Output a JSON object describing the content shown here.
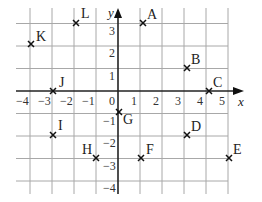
{
  "diagram": {
    "type": "coordinate-grid",
    "axes": {
      "x_label": "x",
      "y_label": "y"
    },
    "x_ticks": [
      "−4",
      "−3",
      "−2",
      "−1",
      "0",
      "1",
      "2",
      "3",
      "4",
      "5"
    ],
    "y_ticks": [
      "3",
      "2",
      "1",
      "−1",
      "−2",
      "−3",
      "−4"
    ],
    "points": [
      {
        "label": "A",
        "x": 1.2,
        "y": 3.4
      },
      {
        "label": "B",
        "x": 3.2,
        "y": 1.4
      },
      {
        "label": "C",
        "x": 4.2,
        "y": 0
      },
      {
        "label": "D",
        "x": 3.2,
        "y": -1.4
      },
      {
        "label": "E",
        "x": 5.2,
        "y": -2.5
      },
      {
        "label": "F",
        "x": 1.2,
        "y": -2.5
      },
      {
        "label": "G",
        "x": 0.1,
        "y": -0.8
      },
      {
        "label": "H",
        "x": -1,
        "y": -2.5
      },
      {
        "label": "I",
        "x": -3,
        "y": -1.5
      },
      {
        "label": "J",
        "x": -3,
        "y": 0
      },
      {
        "label": "K",
        "x": -4,
        "y": 2.2
      },
      {
        "label": "L",
        "x": -2,
        "y": 3.3
      }
    ]
  }
}
